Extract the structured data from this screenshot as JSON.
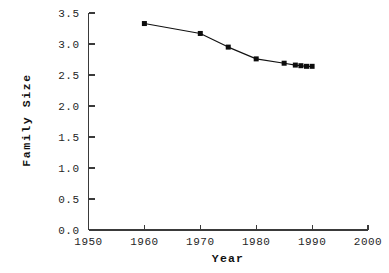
{
  "chart_data": {
    "type": "line",
    "title": "",
    "xlabel": "Year",
    "ylabel": "Family Size",
    "xlim": [
      1950,
      2000
    ],
    "ylim": [
      0.0,
      3.5
    ],
    "grid": false,
    "legend": null,
    "marker": "filled-square",
    "x": [
      1960,
      1970,
      1975,
      1980,
      1985,
      1987,
      1988,
      1989,
      1990
    ],
    "values": [
      3.33,
      3.17,
      2.95,
      2.76,
      2.69,
      2.66,
      2.65,
      2.64,
      2.64
    ],
    "series": [
      {
        "name": "Family Size",
        "x": [
          1960,
          1970,
          1975,
          1980,
          1985,
          1987,
          1988,
          1989,
          1990
        ],
        "values": [
          3.33,
          3.17,
          2.95,
          2.76,
          2.69,
          2.66,
          2.65,
          2.64,
          2.64
        ]
      }
    ],
    "xticks": [
      1950,
      1960,
      1970,
      1980,
      1990,
      2000
    ],
    "xtick_labels": [
      "1950",
      "1960",
      "1970",
      "1980",
      "1990",
      "2000"
    ],
    "yticks": [
      0.0,
      0.5,
      1.0,
      1.5,
      2.0,
      2.5,
      3.0,
      3.5
    ],
    "ytick_labels": [
      "0.0",
      "0.5",
      "1.0",
      "1.5",
      "2.0",
      "2.5",
      "3.0",
      "3.5"
    ],
    "colors": {
      "line": "#111111",
      "marker": "#0d0d0d",
      "axis": "#3a3a3a",
      "text": "#262626",
      "background": "#ffffff"
    }
  }
}
